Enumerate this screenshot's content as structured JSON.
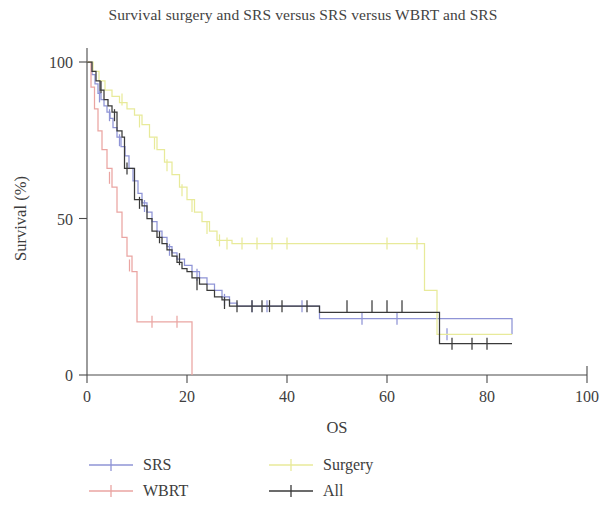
{
  "chart_data": {
    "type": "line",
    "title": "Survival surgery and SRS versus SRS versus WBRT and SRS",
    "subtitle": "",
    "xlabel": "OS",
    "ylabel": "Survival (%)",
    "xlim": [
      0,
      100
    ],
    "ylim": [
      0,
      100
    ],
    "xticks": [
      0,
      20,
      40,
      60,
      80,
      100
    ],
    "yticks": [
      0,
      50,
      100
    ],
    "grid": false,
    "legend_position": "below",
    "curve_style": "step",
    "series": [
      {
        "name": "SRS",
        "color": "#8f94d6",
        "x": [
          0,
          1,
          1.6,
          2.2,
          2.8,
          3.4,
          4,
          4.6,
          5.2,
          6,
          6.8,
          7.6,
          8.4,
          9.2,
          10.2,
          11,
          12,
          13,
          14,
          15,
          16,
          17,
          18,
          19.5,
          21,
          22.5,
          24,
          25.5,
          27,
          28.5,
          30,
          46,
          46.5,
          70,
          85
        ],
        "y": [
          100,
          96,
          93,
          90,
          88,
          86,
          84,
          82,
          79,
          76,
          73,
          70,
          66,
          62,
          58,
          55,
          52,
          49,
          46,
          44,
          41,
          39,
          37,
          35,
          33,
          31,
          29,
          27,
          25,
          23,
          22,
          22,
          18,
          18,
          13
        ],
        "censor_x": [
          2.5,
          4.5,
          6.5,
          11.5,
          16.5,
          22,
          27.5,
          33,
          36,
          43,
          55,
          62,
          72
        ],
        "censor_y": [
          89,
          83,
          75,
          54,
          40,
          32,
          24,
          22,
          22,
          22,
          18,
          18,
          13
        ]
      },
      {
        "name": "WBRT",
        "color": "#eaa5a2",
        "x": [
          0,
          0.8,
          1.5,
          2.2,
          3,
          4,
          5,
          6,
          7,
          8,
          9,
          10,
          21,
          21
        ],
        "y": [
          100,
          92,
          85,
          78,
          72,
          66,
          60,
          52,
          44,
          38,
          33,
          17,
          17,
          0
        ],
        "censor_x": [
          4.5,
          8.5,
          13,
          18
        ],
        "censor_y": [
          63,
          35,
          17,
          17
        ]
      },
      {
        "name": "Surgery",
        "color": "#e8ea9a",
        "x": [
          0,
          1.2,
          2.4,
          3.6,
          5,
          6.5,
          8,
          9.5,
          11,
          12.5,
          14,
          15.5,
          17,
          18.5,
          20,
          21.5,
          23,
          24.5,
          26,
          29,
          67,
          67.5,
          70,
          85
        ],
        "y": [
          100,
          97,
          94,
          91,
          89,
          87,
          85,
          83,
          80,
          76,
          72,
          68,
          64,
          60,
          56,
          52,
          49,
          46,
          43,
          42,
          42,
          27,
          13,
          13
        ],
        "censor_x": [
          7,
          10.5,
          13.5,
          16,
          19,
          21,
          24,
          26.5,
          28,
          31,
          34,
          37,
          40,
          60,
          66
        ],
        "censor_y": [
          88,
          81,
          74,
          67,
          59,
          54,
          47,
          43,
          42,
          42,
          42,
          42,
          42,
          42,
          42
        ]
      },
      {
        "name": "All",
        "color": "#3a3a3a",
        "x": [
          0,
          1,
          1.8,
          2.6,
          3.4,
          4.2,
          5,
          6,
          7,
          7.5,
          9,
          9.5,
          11,
          12,
          13,
          14,
          15,
          16,
          17,
          18,
          19,
          20,
          21,
          22.5,
          24,
          25.5,
          27,
          28.5,
          29,
          46,
          46.5,
          70,
          70.5,
          85
        ],
        "y": [
          100,
          97,
          94,
          91,
          88,
          86,
          84,
          78,
          76,
          66,
          66,
          56,
          54,
          50,
          46,
          44,
          42,
          40,
          38,
          36,
          34,
          33,
          31,
          29,
          27,
          25,
          24,
          22,
          22,
          22,
          20,
          20,
          10,
          10
        ],
        "censor_x": [
          2.8,
          5.5,
          8,
          10.5,
          14.5,
          18.5,
          22,
          27.5,
          30,
          33,
          35,
          36.5,
          39,
          44,
          52,
          57,
          60,
          63,
          73,
          77,
          80
        ],
        "censor_y": [
          92,
          83,
          66,
          55,
          44,
          37,
          29,
          23,
          22,
          22,
          22,
          22,
          22,
          22,
          22,
          22,
          22,
          22,
          10,
          10,
          10
        ]
      }
    ]
  },
  "legend": {
    "entries": [
      {
        "label": "SRS",
        "color": "#8f94d6"
      },
      {
        "label": "Surgery",
        "color": "#e8ea9a"
      },
      {
        "label": "WBRT",
        "color": "#eaa5a2"
      },
      {
        "label": "All",
        "color": "#3a3a3a"
      }
    ]
  }
}
